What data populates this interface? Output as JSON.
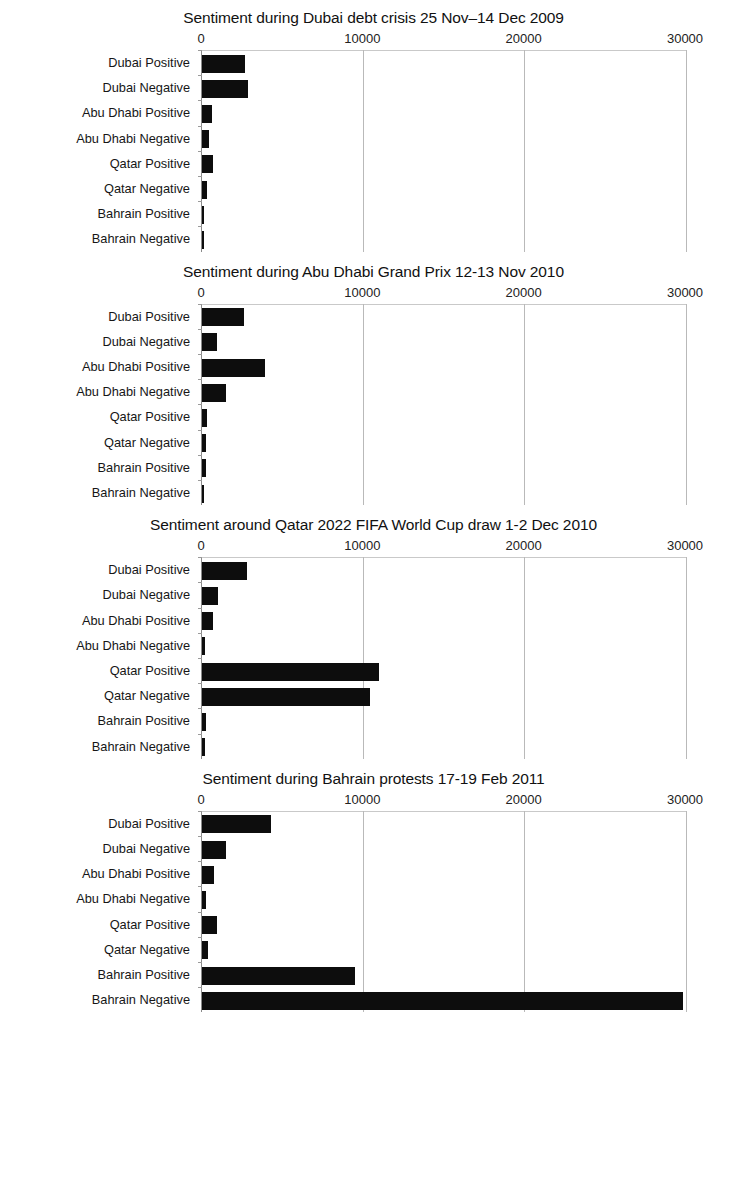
{
  "figure": {
    "axis_ticks": [
      "0",
      "10000",
      "20000",
      "30000"
    ],
    "axis_min": 0,
    "axis_max": 30000,
    "bar_color": "#0d0d0d",
    "gridline_color": "#b9b9b9",
    "background": "#ffffff"
  },
  "charts": [
    {
      "title": "Sentiment during Dubai debt crisis 25 Nov–14 Dec 2009",
      "categories": [
        "Dubai Positive",
        "Dubai Negative",
        "Abu Dhabi Positive",
        "Abu Dhabi Negative",
        "Qatar Positive",
        "Qatar Negative",
        "Bahrain Positive",
        "Bahrain Negative"
      ],
      "values": [
        2650,
        2850,
        620,
        430,
        680,
        300,
        60,
        40
      ]
    },
    {
      "title": "Sentiment during Abu Dhabi Grand Prix 12-13 Nov 2010",
      "categories": [
        "Dubai Positive",
        "Dubai Negative",
        "Abu Dhabi Positive",
        "Abu Dhabi Negative",
        "Qatar Positive",
        "Qatar Negative",
        "Bahrain Positive",
        "Bahrain Negative"
      ],
      "values": [
        2600,
        900,
        3900,
        1480,
        300,
        250,
        220,
        120
      ]
    },
    {
      "title": "Sentiment around Qatar 2022 FIFA World Cup draw 1-2 Dec 2010",
      "categories": [
        "Dubai Positive",
        "Dubai Negative",
        "Abu Dhabi Positive",
        "Abu Dhabi Negative",
        "Qatar Positive",
        "Qatar Negative",
        "Bahrain Positive",
        "Bahrain Negative"
      ],
      "values": [
        2800,
        1000,
        680,
        180,
        11000,
        10400,
        230,
        180
      ]
    },
    {
      "title": "Sentiment during Bahrain protests 17-19 Feb 2011",
      "categories": [
        "Dubai Positive",
        "Dubai Negative",
        "Abu Dhabi Positive",
        "Abu Dhabi Negative",
        "Qatar Positive",
        "Qatar Negative",
        "Bahrain Positive",
        "Bahrain Negative"
      ],
      "values": [
        4250,
        1480,
        760,
        240,
        920,
        400,
        9500,
        29800
      ]
    }
  ],
  "chart_data": [
    {
      "type": "bar",
      "orientation": "horizontal",
      "title": "Sentiment during Dubai debt crisis 25 Nov–14 Dec 2009",
      "categories": [
        "Dubai Positive",
        "Dubai Negative",
        "Abu Dhabi Positive",
        "Abu Dhabi Negative",
        "Qatar Positive",
        "Qatar Negative",
        "Bahrain Positive",
        "Bahrain Negative"
      ],
      "values": [
        2650,
        2850,
        620,
        430,
        680,
        300,
        60,
        40
      ],
      "xlabel": "",
      "ylabel": "",
      "xlim": [
        0,
        30000
      ],
      "xticks": [
        0,
        10000,
        20000,
        30000
      ],
      "grid": true,
      "legend": false
    },
    {
      "type": "bar",
      "orientation": "horizontal",
      "title": "Sentiment during Abu Dhabi Grand Prix 12-13 Nov 2010",
      "categories": [
        "Dubai Positive",
        "Dubai Negative",
        "Abu Dhabi Positive",
        "Abu Dhabi Negative",
        "Qatar Positive",
        "Qatar Negative",
        "Bahrain Positive",
        "Bahrain Negative"
      ],
      "values": [
        2600,
        900,
        3900,
        1480,
        300,
        250,
        220,
        120
      ],
      "xlabel": "",
      "ylabel": "",
      "xlim": [
        0,
        30000
      ],
      "xticks": [
        0,
        10000,
        20000,
        30000
      ],
      "grid": true,
      "legend": false
    },
    {
      "type": "bar",
      "orientation": "horizontal",
      "title": "Sentiment around Qatar 2022 FIFA World Cup draw 1-2 Dec 2010",
      "categories": [
        "Dubai Positive",
        "Dubai Negative",
        "Abu Dhabi Positive",
        "Abu Dhabi Negative",
        "Qatar Positive",
        "Qatar Negative",
        "Bahrain Positive",
        "Bahrain Negative"
      ],
      "values": [
        2800,
        1000,
        680,
        180,
        11000,
        10400,
        230,
        180
      ],
      "xlabel": "",
      "ylabel": "",
      "xlim": [
        0,
        30000
      ],
      "xticks": [
        0,
        10000,
        20000,
        30000
      ],
      "grid": true,
      "legend": false
    },
    {
      "type": "bar",
      "orientation": "horizontal",
      "title": "Sentiment during Bahrain protests 17-19 Feb 2011",
      "categories": [
        "Dubai Positive",
        "Dubai Negative",
        "Abu Dhabi Positive",
        "Abu Dhabi Negative",
        "Qatar Positive",
        "Qatar Negative",
        "Bahrain Positive",
        "Bahrain Negative"
      ],
      "values": [
        4250,
        1480,
        760,
        240,
        920,
        400,
        9500,
        29800
      ],
      "xlabel": "",
      "ylabel": "",
      "xlim": [
        0,
        30000
      ],
      "xticks": [
        0,
        10000,
        20000,
        30000
      ],
      "grid": true,
      "legend": false
    }
  ]
}
